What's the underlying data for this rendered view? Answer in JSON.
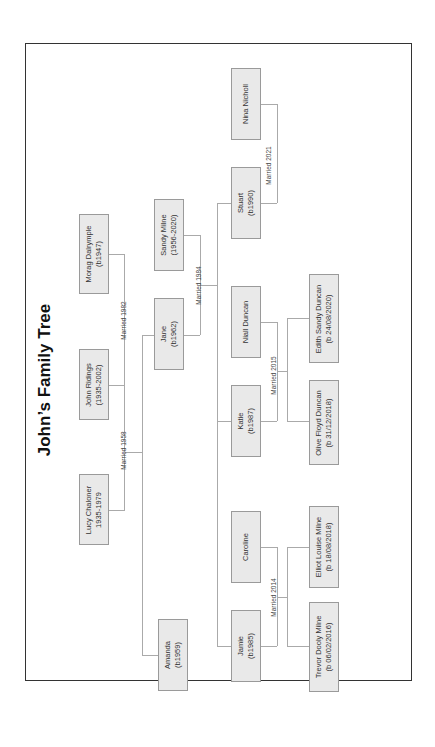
{
  "title": "John’s Family Tree",
  "people": {
    "nina": {
      "name": "Nina Nicholl",
      "dates": ""
    },
    "stuart": {
      "name": "Stuart",
      "dates": "(b1990)"
    },
    "sandy": {
      "name": "Sandy Milne",
      "dates": "(1956-2020)"
    },
    "morag": {
      "name": "Morag Dalrymple",
      "dates": "(b1947)"
    },
    "jane": {
      "name": "Jane",
      "dates": "(b1962)"
    },
    "john": {
      "name": "John Ridings",
      "dates": "(1935-2002)"
    },
    "niall": {
      "name": "Niall Duncan",
      "dates": ""
    },
    "edith": {
      "name": "Edith Sandy Duncan",
      "dates": "(b 24/08/2020)"
    },
    "katie": {
      "name": "Katie",
      "dates": "(b1987)"
    },
    "olive": {
      "name": "Olive Floyd Duncan",
      "dates": "(b 31/12/2018)"
    },
    "lucy": {
      "name": "Lucy Chaloner",
      "dates": "1935-1979"
    },
    "caroline": {
      "name": "Caroline",
      "dates": ""
    },
    "elliot": {
      "name": "Elliot Louise Milne",
      "dates": "(b 18/08/2018)"
    },
    "jamie": {
      "name": "Jamie",
      "dates": "(b1985)"
    },
    "trevor": {
      "name": "Trevor Dooly Milne",
      "dates": "(b 06/02/2016)"
    },
    "amanda": {
      "name": "Amanda",
      "dates": "(b1959)"
    }
  },
  "marriages": {
    "lucy_john": "Married 1958",
    "john_morag": "Married 1982",
    "jane_sandy": "Married 1984",
    "stuart_nina": "Married 2021",
    "katie_niall": "Married 2015",
    "jamie_caroline": "Married 2014"
  },
  "colors": {
    "box_fill": "#e9e9e9",
    "box_border": "#9a9a9a",
    "line": "#aaaaaa",
    "frame": "#333333"
  }
}
